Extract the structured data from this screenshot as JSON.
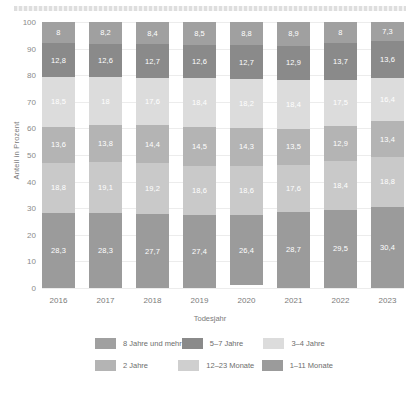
{
  "chart_data": {
    "type": "bar",
    "stacked": true,
    "title": "",
    "xlabel": "Todesjahr",
    "ylabel": "Anteil in Prozent",
    "ylim": [
      0,
      100
    ],
    "yticks": [
      0,
      10,
      20,
      30,
      40,
      50,
      60,
      70,
      80,
      90,
      100
    ],
    "grid": true,
    "legend_position": "bottom",
    "categories": [
      "2016",
      "2017",
      "2018",
      "2019",
      "2020",
      "2021",
      "2022",
      "2023"
    ],
    "series": [
      {
        "name": "1–11 Monate",
        "color": "#9b9b9b",
        "values": [
          28.3,
          28.3,
          27.7,
          27.4,
          26.4,
          28.7,
          29.5,
          30.4
        ],
        "labels": [
          "28,3",
          "28,3",
          "27,7",
          "27,4",
          "26,4",
          "28,7",
          "29,5",
          "30,4"
        ]
      },
      {
        "name": "12–23 Monate",
        "color": "#c9c9c9",
        "values": [
          18.8,
          19.1,
          19.2,
          18.6,
          18.6,
          17.6,
          18.4,
          18.8
        ],
        "labels": [
          "18,8",
          "19,1",
          "19,2",
          "18,6",
          "18,6",
          "17,6",
          "18,4",
          "18,8"
        ]
      },
      {
        "name": "2 Jahre",
        "color": "#b4b4b4",
        "values": [
          13.6,
          13.8,
          14.4,
          14.5,
          14.3,
          13.5,
          12.9,
          13.4
        ],
        "labels": [
          "13,6",
          "13,8",
          "14,4",
          "14,5",
          "14,3",
          "13,5",
          "12,9",
          "13,4"
        ]
      },
      {
        "name": "3–4 Jahre",
        "color": "#dcdcdc",
        "values": [
          18.5,
          18.0,
          17.6,
          18.4,
          18.2,
          18.4,
          17.5,
          16.4
        ],
        "labels": [
          "18,5",
          "18",
          "17,6",
          "18,4",
          "18,2",
          "18,4",
          "17,5",
          "16,4"
        ]
      },
      {
        "name": "5–7 Jahre",
        "color": "#8a8a8a",
        "values": [
          12.8,
          12.6,
          12.7,
          12.6,
          12.7,
          12.9,
          13.7,
          13.6
        ],
        "labels": [
          "12,8",
          "12,6",
          "12,7",
          "12,6",
          "12,7",
          "12,9",
          "13,7",
          "13,6"
        ]
      },
      {
        "name": "8 Jahre und mehr",
        "color": "#a0a0a0",
        "values": [
          8.0,
          8.2,
          8.4,
          8.5,
          8.8,
          8.9,
          8.0,
          7.3
        ],
        "labels": [
          "8",
          "8,2",
          "8,4",
          "8,5",
          "8,8",
          "8,9",
          "8",
          "7,3"
        ]
      }
    ]
  },
  "legend": {
    "rows": [
      [
        {
          "label": "8 Jahre und mehr",
          "color": "#a0a0a0"
        },
        {
          "label": "5–7 Jahre",
          "color": "#8a8a8a"
        },
        {
          "label": "3–4 Jahre",
          "color": "#dcdcdc"
        }
      ],
      [
        {
          "label": "2 Jahre",
          "color": "#b4b4b4"
        },
        {
          "label": "12–23 Monate",
          "color": "#cfcfcf"
        },
        {
          "label": "1–11 Monate",
          "color": "#9b9b9b"
        }
      ]
    ]
  }
}
